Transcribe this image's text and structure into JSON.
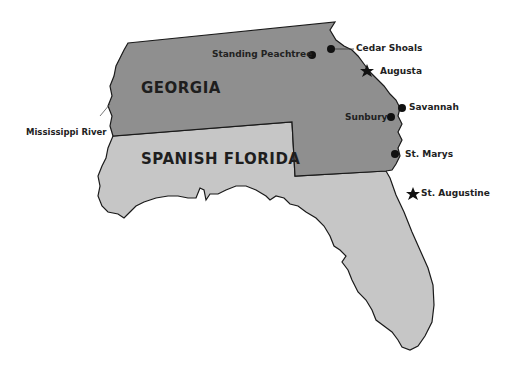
{
  "regions": [
    {
      "id": "georgia",
      "label": "GEORGIA",
      "fill": "#8f8f8f"
    },
    {
      "id": "spanish_florida",
      "label": "SPANISH FLORIDA",
      "fill": "#c6c6c6"
    }
  ],
  "places": [
    {
      "label": "Standing Peachtree",
      "marker": "dot"
    },
    {
      "label": "Cedar Shoals",
      "marker": "dot"
    },
    {
      "label": "Augusta",
      "marker": "star"
    },
    {
      "label": "Savannah",
      "marker": "dot"
    },
    {
      "label": "Sunbury",
      "marker": "dot"
    },
    {
      "label": "St. Marys",
      "marker": "dot"
    },
    {
      "label": "St. Augustine",
      "marker": "star"
    }
  ],
  "annotations": [
    {
      "label": "Mississippi River"
    }
  ],
  "colors": {
    "border": "#1a1a1a",
    "background": "#ffffff",
    "marker": "#111111"
  }
}
